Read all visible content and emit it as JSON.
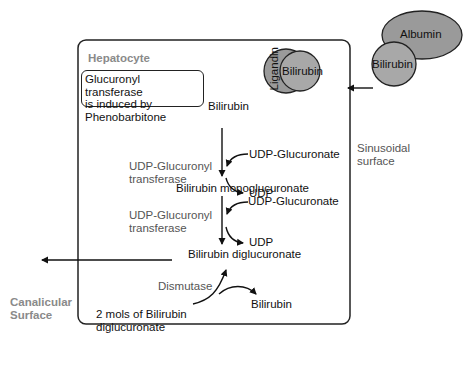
{
  "hepatocyte": {
    "label": "Hepatocyte"
  },
  "note": {
    "lines": [
      "Glucuronyl transferase",
      "is induced by",
      "Phenobarbitone"
    ]
  },
  "complexes": {
    "ligandin": "Ligandin",
    "bilirubin_bound": "Bilirubin",
    "albumin": "Albumin",
    "bilirubin_albumin": "Bilirubin",
    "fill_color": "#9a9a9a",
    "stroke_color": "#222222"
  },
  "pathway": {
    "start": "Bilirubin",
    "step1_enzyme": [
      "UDP-Glucuronyl",
      "transferase"
    ],
    "step1_input": "UDP-Glucuronate",
    "step1_output": "UDP",
    "intermediate": "Bilirubin monoglucuronate",
    "step2_enzyme": [
      "UDP-Glucuronyl",
      "transferase"
    ],
    "step2_input": "UDP-Glucuronate",
    "step2_output": "UDP",
    "product": "Bilirubin diglucuronate",
    "dismutase": "Dismutase",
    "dismutase_substrate": [
      "2 mols of Bilirubin",
      "diglucuronate"
    ],
    "dismutase_output": "Bilirubin"
  },
  "surfaces": {
    "sinusoidal": [
      "Sinusoidal",
      "surface"
    ],
    "canalicular": [
      "Canalicular",
      "Surface"
    ]
  }
}
